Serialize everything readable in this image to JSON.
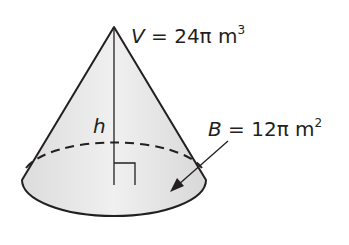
{
  "figure": {
    "type": "cone",
    "volume_label": {
      "var": "V",
      "eq": "=",
      "value": "24π m",
      "exp": "3"
    },
    "base_label": {
      "var": "B",
      "eq": "=",
      "value": "12π m",
      "exp": "2"
    },
    "height_label": "h",
    "colors": {
      "fill": "#e6e6e6",
      "stroke": "#231f20"
    }
  }
}
